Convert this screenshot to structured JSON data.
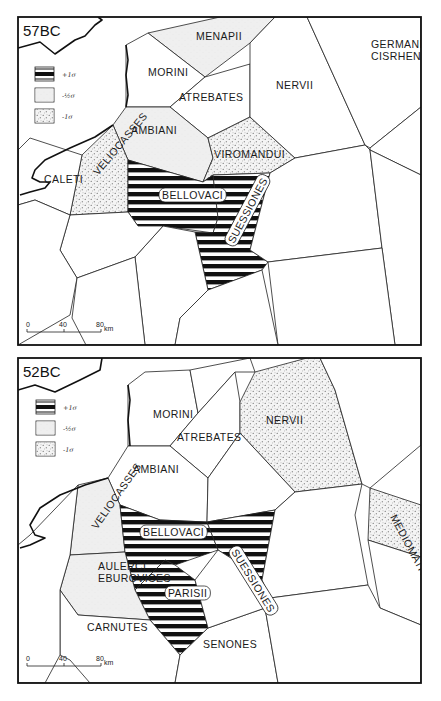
{
  "colors": {
    "ink": "#111111",
    "paper": "#ffffff",
    "light_fill": "#f1f1f1",
    "dot_fill": "#ebebeb",
    "stripe": "#111111"
  },
  "legend": {
    "items": [
      {
        "pattern": "stripes",
        "label": "+1σ"
      },
      {
        "pattern": "light",
        "label": "-½σ"
      },
      {
        "pattern": "dots",
        "label": "-1σ"
      }
    ]
  },
  "scale_bar": {
    "ticks": [
      "0",
      "40",
      "80"
    ],
    "unit": "km"
  },
  "panels": [
    {
      "title": "57BC",
      "top": 0,
      "regions": [
        {
          "name": "Menapii",
          "pattern": "light",
          "label": "MENAPII",
          "lx": 196,
          "ly": 40,
          "points": "148,33 220,17 275,17 250,43 205,77"
        },
        {
          "name": "Morini",
          "pattern": "none",
          "label": "MORINI",
          "lx": 148,
          "ly": 76,
          "points": "126,45 148,33 205,77 170,107 126,107"
        },
        {
          "name": "Atrebates",
          "pattern": "none",
          "label": "ATREBATES",
          "lx": 179,
          "ly": 101,
          "points": "170,107 205,77 250,64 250,117 208,138"
        },
        {
          "name": "Ambiani",
          "pattern": "light",
          "label": "AMBIANI",
          "lx": 131,
          "ly": 134,
          "points": "126,107 170,107 208,138 213,158 203,182 128,160 113,125"
        },
        {
          "name": "Viromandui",
          "pattern": "dots",
          "label": "VIROMANDUI",
          "lx": 214,
          "ly": 158,
          "points": "208,138 250,117 295,158 270,173 213,175 203,182 213,158"
        },
        {
          "name": "Veliocasses",
          "pattern": "dots",
          "label": "VELIOCASSES",
          "lx": 98,
          "ly": 176,
          "rot": -50,
          "points": "82,155 113,125 128,160 128,212 70,215"
        },
        {
          "name": "Bellovaci",
          "pattern": "stripes",
          "label": "BELLOVACI",
          "lx": 162,
          "ly": 199,
          "halo": true,
          "points": "128,160 203,182 213,175 218,218 213,233 163,226 138,226 128,212"
        },
        {
          "name": "Suessiones",
          "pattern": "stripes",
          "label": "SUESSIONES",
          "lx": 234,
          "ly": 244,
          "rot": -62,
          "halo": true,
          "points": "213,175 270,173 250,250 268,262 262,270 208,290 195,232 213,233 218,218"
        },
        {
          "name": "Caleti",
          "pattern": "none",
          "label": "CALETI",
          "lx": 44,
          "ly": 183,
          "points": "18,150 30,138 82,155 70,215 35,200 18,205"
        },
        {
          "name": "Nervii",
          "pattern": "none",
          "label": "NERVII",
          "lx": 276,
          "ly": 89,
          "points": "250,43 275,17 307,17 365,145 295,158 250,117 250,64"
        },
        {
          "name": "Germani Cisrhenani",
          "pattern": "none",
          "label": "GERMANI",
          "label2": "CISRHENANI",
          "lx": 371,
          "ly": 48,
          "points": "307,17 421,17 421,107 370,148 365,145"
        },
        {
          "name": "SE-1",
          "pattern": "none",
          "points": "295,158 365,145 370,150 382,248 268,262 250,250 270,173"
        },
        {
          "name": "E-1",
          "pattern": "none",
          "points": "370,148 421,107 421,175 370,150"
        },
        {
          "name": "E-2",
          "pattern": "none",
          "points": "370,150 421,175 421,345 395,345 382,248"
        },
        {
          "name": "S-1",
          "pattern": "none",
          "points": "268,262 382,248 395,345 278,345"
        },
        {
          "name": "S-2",
          "pattern": "none",
          "points": "163,226 195,232 208,290 180,318 175,345 145,345 135,257"
        },
        {
          "name": "S-3",
          "pattern": "none",
          "points": "70,215 128,212 138,226 163,226 135,257 77,278 60,250"
        },
        {
          "name": "S-4",
          "pattern": "none",
          "points": "18,205 35,200 70,215 60,250 77,278 70,315 18,345"
        },
        {
          "name": "S-5",
          "pattern": "none",
          "points": "77,278 135,257 145,345 86,345 72,318"
        },
        {
          "name": "S-6",
          "pattern": "none",
          "points": "208,290 262,270 278,345 175,345 180,318"
        }
      ],
      "coast": "18,48 40,42 55,54 75,40 85,36 95,25 102,20 98,17 M126,45 128,60 126,75 128,95 126,107 M113,125 95,137 70,148 45,160 35,170 32,178 40,182 50,182 45,188 30,192 20,195",
      "legend_x": 35,
      "legend_y": 67,
      "scale_x": 27,
      "scale_y": 332
    },
    {
      "title": "52BC",
      "top": 0,
      "regions": [
        {
          "name": "Morini",
          "pattern": "none",
          "label": "MORINI",
          "lx": 153,
          "ly": 418,
          "points": "145,372 190,370 198,413 170,446 128,446 128,385"
        },
        {
          "name": "Top-mid",
          "pattern": "none",
          "points": "190,370 250,358 255,372 235,372 198,413"
        },
        {
          "name": "Atrebates",
          "pattern": "none",
          "label": "ATREBATES",
          "lx": 177,
          "ly": 441,
          "points": "170,446 198,413 235,372 240,402 240,433 208,478"
        },
        {
          "name": "Nervii",
          "pattern": "dots",
          "label": "NERVII",
          "lx": 266,
          "ly": 424,
          "points": "255,372 307,358 320,358 335,390 362,484 295,492 240,433 240,402"
        },
        {
          "name": "Ambiani",
          "pattern": "none",
          "label": "AMBIANI",
          "lx": 133,
          "ly": 473,
          "points": "128,446 170,446 208,478 207,522 160,520 120,505 108,478"
        },
        {
          "name": "Mid-E",
          "pattern": "none",
          "points": "208,478 240,433 295,492 275,510 207,522"
        },
        {
          "name": "Veliocasses",
          "pattern": "light",
          "label": "VELIOCASSES",
          "lx": 97,
          "ly": 530,
          "rot": -55,
          "points": "78,485 108,478 120,505 125,552 70,555"
        },
        {
          "name": "Bellovaci",
          "pattern": "stripes",
          "label": "BELLOVACI",
          "lx": 143,
          "ly": 536,
          "halo": true,
          "points": "120,505 160,520 207,522 218,550 175,565 165,560 135,590 125,552"
        },
        {
          "name": "Suessiones",
          "pattern": "stripes",
          "label": "SUESSIONES",
          "lx": 231,
          "ly": 552,
          "rot": 58,
          "halo": true,
          "points": "207,522 275,510 262,580 250,570 218,550"
        },
        {
          "name": "Parisii",
          "pattern": "stripes",
          "label": "PARISII",
          "lx": 168,
          "ly": 597,
          "halo": true,
          "points": "135,590 165,560 175,565 195,580 208,628 180,655 150,620"
        },
        {
          "name": "Aulerci Eburovices",
          "pattern": "light",
          "label": "AULERCI",
          "label2": "EBUROVICES",
          "lx": 98,
          "ly": 570,
          "points": "70,555 125,552 135,590 150,620 78,615 60,590"
        },
        {
          "name": "Carnutes",
          "pattern": "none",
          "label": "CARNUTES",
          "lx": 87,
          "ly": 631,
          "points": "60,590 78,615 150,620 180,655 175,683 90,683 70,660 60,655"
        },
        {
          "name": "Senones",
          "pattern": "none",
          "label": "SENONES",
          "lx": 203,
          "ly": 648,
          "points": "208,628 265,608 278,683 175,683 180,655"
        },
        {
          "name": "Mid-SE",
          "pattern": "none",
          "points": "195,580 218,550 250,570 262,580 270,598 265,608 208,628"
        },
        {
          "name": "E-mid",
          "pattern": "none",
          "points": "262,580 275,510 295,492 362,484 355,515 368,585 270,598"
        },
        {
          "name": "Mediomatrici",
          "pattern": "dots",
          "label": "MEDIOMATRICI",
          "lx": 390,
          "ly": 517,
          "rot": 62,
          "points": "370,488 421,505 421,557 368,540"
        },
        {
          "name": "NE",
          "pattern": "none",
          "points": "320,358 421,358 421,445 370,488 362,484 335,390"
        },
        {
          "name": "E-low",
          "pattern": "none",
          "points": "368,540 421,557 421,625 380,608"
        },
        {
          "name": "SE",
          "pattern": "none",
          "points": "270,598 368,585 380,608 421,625 421,683 340,683 278,683 265,608"
        },
        {
          "name": "W-low",
          "pattern": "none",
          "points": "18,545 30,535 78,485 70,555 60,590 60,655 45,683 18,683"
        }
      ],
      "coast": "18,390 35,385 55,392 80,380 100,370 102,358 M128,385 130,400 128,420 130,446 M108,478 85,485 60,495 40,508 30,525 35,535 45,538 30,545 20,548",
      "legend_x": 36,
      "legend_y": 400,
      "scale_x": 27,
      "scale_y": 666
    }
  ]
}
